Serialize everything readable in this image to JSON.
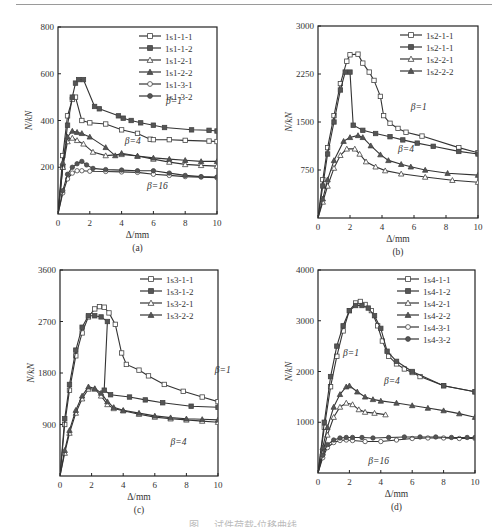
{
  "figure": {
    "caption_partial": "图 … 试件荷载-位移曲线 …"
  },
  "chart_data": [
    {
      "panel": "(a)",
      "type": "line",
      "xlabel": "Δ/mm",
      "ylabel": "N/kN",
      "xlim": [
        0,
        10
      ],
      "ylim": [
        0,
        800
      ],
      "xticks": [
        0,
        2,
        4,
        6,
        8,
        10
      ],
      "yticks": [
        200,
        400,
        600,
        800
      ],
      "ytick_labels": [
        "200",
        "400",
        "600",
        "800"
      ],
      "legend_position": "upper right",
      "series": [
        {
          "name": "1s1-1-1",
          "marker": "square-open",
          "x": [
            0,
            0.3,
            0.6,
            0.9,
            1.1,
            1.5,
            2.0,
            3.0,
            4.0,
            5.0,
            5.8,
            6.0,
            7.0,
            8.0,
            9.5,
            10
          ],
          "y": [
            0,
            250,
            420,
            490,
            500,
            400,
            390,
            385,
            360,
            345,
            320,
            318,
            318,
            315,
            312,
            310
          ]
        },
        {
          "name": "1s1-1-2",
          "marker": "square-filled",
          "x": [
            0,
            0.3,
            0.6,
            0.9,
            1.1,
            1.3,
            1.6,
            2.3,
            2.6,
            3.8,
            4.1,
            4.6,
            5.2,
            6.0,
            6.7,
            8.4,
            9.5,
            10
          ],
          "y": [
            0,
            200,
            380,
            500,
            560,
            575,
            575,
            460,
            450,
            420,
            410,
            400,
            390,
            380,
            370,
            360,
            358,
            355
          ]
        },
        {
          "name": "1s1-2-1",
          "marker": "triangle-open",
          "x": [
            0,
            0.3,
            0.6,
            0.9,
            1.2,
            1.6,
            2.2,
            3.0,
            4.0,
            5.0,
            6.0,
            7.0,
            8.0,
            9.0,
            10
          ],
          "y": [
            0,
            200,
            310,
            325,
            315,
            300,
            265,
            250,
            255,
            248,
            235,
            222,
            212,
            208,
            205
          ]
        },
        {
          "name": "1s1-2-2",
          "marker": "triangle-filled",
          "x": [
            0,
            0.3,
            0.6,
            0.9,
            1.2,
            1.5,
            2.0,
            3.0,
            3.6,
            4.0,
            5.0,
            6.0,
            7.0,
            8.0,
            9.0,
            10
          ],
          "y": [
            0,
            220,
            330,
            355,
            350,
            345,
            330,
            285,
            250,
            260,
            248,
            240,
            235,
            230,
            225,
            225
          ]
        },
        {
          "name": "1s1-3-1",
          "marker": "circle-open",
          "x": [
            0,
            0.3,
            0.6,
            0.9,
            1.2,
            1.5,
            2.0,
            3.0,
            4.0,
            5.0,
            6.0,
            7.0,
            8.0,
            9.0,
            10
          ],
          "y": [
            0,
            90,
            150,
            175,
            185,
            185,
            183,
            182,
            180,
            178,
            170,
            165,
            160,
            158,
            155
          ]
        },
        {
          "name": "1s1-3-2",
          "marker": "circle-filled",
          "x": [
            0,
            0.3,
            0.6,
            0.9,
            1.2,
            1.5,
            1.8,
            2.2,
            3.0,
            4.0,
            5.0,
            6.0,
            7.0,
            8.0,
            9.0,
            10
          ],
          "y": [
            0,
            100,
            170,
            200,
            215,
            225,
            210,
            195,
            190,
            188,
            185,
            185,
            175,
            165,
            160,
            158
          ]
        }
      ],
      "annotations": [
        {
          "text": "β=1",
          "x": 6.8,
          "y": 470
        },
        {
          "text": "β=4",
          "x": 4.2,
          "y": 300
        },
        {
          "text": "β=16",
          "x": 5.6,
          "y": 105
        }
      ]
    },
    {
      "panel": "(b)",
      "type": "line",
      "xlabel": "Δ/mm",
      "ylabel": "N/kN",
      "xlim": [
        0,
        10
      ],
      "ylim": [
        0,
        3000
      ],
      "xticks": [
        0,
        2,
        4,
        6,
        8,
        10
      ],
      "yticks": [
        750,
        1500,
        2250,
        3000
      ],
      "ytick_labels": [
        "750",
        "1500",
        "2250",
        "3000"
      ],
      "legend_position": "upper right",
      "series": [
        {
          "name": "1s2-1-1",
          "marker": "square-open",
          "x": [
            0,
            0.3,
            0.6,
            1.0,
            1.4,
            1.8,
            2.0,
            2.5,
            2.8,
            3.2,
            3.5,
            3.9,
            4.1,
            4.5,
            5.0,
            5.5,
            6.5,
            8.8,
            10
          ],
          "y": [
            0,
            600,
            1100,
            1600,
            2100,
            2450,
            2550,
            2560,
            2420,
            2280,
            2150,
            1900,
            1600,
            1480,
            1400,
            1340,
            1280,
            1100,
            1020
          ]
        },
        {
          "name": "1s2-1-1",
          "marker": "square-filled",
          "x": [
            0,
            0.3,
            0.6,
            1.0,
            1.4,
            1.7,
            2.0,
            2.2,
            2.8,
            3.6,
            4.5,
            5.3,
            6.2,
            7.2,
            8.8,
            10
          ],
          "y": [
            0,
            500,
            1000,
            1500,
            2000,
            2280,
            2280,
            1450,
            1370,
            1320,
            1270,
            1220,
            1170,
            1120,
            1040,
            1000
          ]
        },
        {
          "name": "1s2-2-1",
          "marker": "triangle-open",
          "x": [
            0,
            0.3,
            0.6,
            1.0,
            1.4,
            1.8,
            2.3,
            2.6,
            3.0,
            3.6,
            4.2,
            5.2,
            6.7,
            8.4,
            10
          ],
          "y": [
            0,
            250,
            500,
            780,
            980,
            1080,
            1080,
            1000,
            880,
            800,
            740,
            690,
            640,
            590,
            560
          ]
        },
        {
          "name": "1s2-2-2",
          "marker": "triangle-filled",
          "x": [
            0,
            0.3,
            0.6,
            1.0,
            1.6,
            2.0,
            2.5,
            2.8,
            3.3,
            3.9,
            4.4,
            5.2,
            5.8,
            6.7,
            8.1,
            10
          ],
          "y": [
            0,
            300,
            600,
            900,
            1200,
            1260,
            1290,
            1260,
            1130,
            990,
            900,
            840,
            800,
            750,
            700,
            670
          ]
        }
      ],
      "annotations": [
        {
          "text": "β=1",
          "x": 5.8,
          "y": 1680
        },
        {
          "text": "β=4",
          "x": 5.0,
          "y": 1030
        }
      ]
    },
    {
      "panel": "(c)",
      "type": "line",
      "xlabel": "Δ/mm",
      "ylabel": "N/kN",
      "xlim": [
        0,
        10
      ],
      "ylim": [
        0,
        3600
      ],
      "xticks": [
        0,
        2,
        4,
        6,
        8,
        10
      ],
      "yticks": [
        900,
        1800,
        2700,
        3600
      ],
      "ytick_labels": [
        "900",
        "1800",
        "2700",
        "3600"
      ],
      "legend_position": "upper right",
      "series": [
        {
          "name": "1s3-1-1",
          "marker": "square-open",
          "x": [
            0,
            0.3,
            0.6,
            1.0,
            1.4,
            1.8,
            2.2,
            2.5,
            2.8,
            3.1,
            3.5,
            3.9,
            4.2,
            5.0,
            5.6,
            6.6,
            7.8,
            9.0,
            10
          ],
          "y": [
            0,
            900,
            1500,
            2100,
            2500,
            2780,
            2920,
            2960,
            2950,
            2850,
            2650,
            2150,
            1950,
            1850,
            1750,
            1600,
            1480,
            1380,
            1300
          ]
        },
        {
          "name": "1s3-1-2",
          "marker": "square-filled",
          "x": [
            0,
            0.3,
            0.6,
            1.0,
            1.4,
            1.8,
            2.2,
            2.6,
            3.0,
            2.8,
            3.2,
            4.4,
            5.4,
            6.5,
            8.3,
            10
          ],
          "y": [
            0,
            1000,
            1600,
            2200,
            2600,
            2800,
            2800,
            2780,
            2700,
            1500,
            1420,
            1380,
            1330,
            1280,
            1220,
            1200
          ]
        },
        {
          "name": "1s3-2-1",
          "marker": "triangle-open",
          "x": [
            0,
            0.3,
            0.6,
            1.0,
            1.4,
            1.8,
            2.2,
            2.6,
            3.0,
            3.4,
            4.0,
            5.0,
            6.0,
            7.0,
            8.0,
            9.0,
            10
          ],
          "y": [
            0,
            400,
            750,
            1100,
            1350,
            1520,
            1520,
            1400,
            1250,
            1180,
            1140,
            1080,
            1030,
            1000,
            980,
            960,
            940
          ]
        },
        {
          "name": "1s3-2-2",
          "marker": "triangle-filled",
          "x": [
            0,
            0.3,
            0.6,
            1.0,
            1.4,
            1.8,
            2.2,
            2.6,
            3.0,
            3.4,
            4.0,
            5.0,
            6.0,
            7.0,
            8.0,
            9.0,
            10
          ],
          "y": [
            0,
            450,
            800,
            1150,
            1400,
            1560,
            1530,
            1450,
            1300,
            1200,
            1150,
            1100,
            1050,
            1020,
            1000,
            990,
            980
          ]
        }
      ],
      "annotations": [
        {
          "text": "β=1",
          "x": 9.8,
          "y": 1800
        },
        {
          "text": "β=4",
          "x": 7.0,
          "y": 540
        }
      ]
    },
    {
      "panel": "(d)",
      "type": "line",
      "xlabel": "Δ/mm",
      "ylabel": "N/kN",
      "xlim": [
        0,
        10
      ],
      "ylim": [
        0,
        4000
      ],
      "xticks": [
        0,
        2,
        4,
        6,
        8,
        10
      ],
      "yticks": [
        1000,
        2000,
        3000,
        4000
      ],
      "ytick_labels": [
        "1000",
        "2000",
        "3000",
        "4000"
      ],
      "legend_position": "upper right",
      "series": [
        {
          "name": "1s4-1-1",
          "marker": "square-open",
          "x": [
            0,
            0.4,
            0.8,
            1.2,
            1.6,
            2.0,
            2.4,
            2.7,
            3.0,
            3.4,
            3.8,
            4.1,
            4.5,
            5.0,
            5.5,
            6.0,
            6.5,
            8.0,
            10
          ],
          "y": [
            0,
            900,
            1700,
            2300,
            2800,
            3200,
            3350,
            3380,
            3320,
            3200,
            2900,
            2600,
            2300,
            2150,
            2050,
            1980,
            1900,
            1720,
            1600
          ]
        },
        {
          "name": "1s4-1-2",
          "marker": "square-filled",
          "x": [
            0,
            0.4,
            0.8,
            1.2,
            1.6,
            2.0,
            2.4,
            2.8,
            3.2,
            3.6,
            4.0,
            4.4,
            5.0,
            6.0,
            8.0,
            10
          ],
          "y": [
            0,
            1000,
            1900,
            2500,
            2900,
            3200,
            3300,
            3300,
            3250,
            3100,
            2850,
            2400,
            2200,
            2000,
            1720,
            1600
          ]
        },
        {
          "name": "1s4-2-1",
          "marker": "triangle-open",
          "x": [
            0,
            0.3,
            0.6,
            1.0,
            1.4,
            1.8,
            2.2,
            2.6,
            3.0,
            3.6,
            4.3
          ],
          "y": [
            0,
            400,
            750,
            1100,
            1300,
            1380,
            1350,
            1250,
            1200,
            1180,
            1150
          ]
        },
        {
          "name": "1s4-2-2",
          "marker": "triangle-filled",
          "x": [
            0,
            0.3,
            0.6,
            1.0,
            1.4,
            1.8,
            2.0,
            2.5,
            3.0,
            3.5,
            4.0,
            5.0,
            6.0,
            7.0,
            8.0,
            9.0,
            10
          ],
          "y": [
            0,
            500,
            900,
            1300,
            1550,
            1700,
            1720,
            1600,
            1500,
            1450,
            1420,
            1380,
            1330,
            1280,
            1230,
            1170,
            1100
          ]
        },
        {
          "name": "1s4-3-1",
          "marker": "circle-open",
          "x": [
            0,
            0.3,
            0.6,
            1.0,
            1.4,
            1.8,
            2.2,
            3.0,
            4.0,
            5.0,
            6.0,
            7.0,
            8.0,
            9.0,
            10
          ],
          "y": [
            0,
            300,
            500,
            600,
            640,
            650,
            640,
            620,
            620,
            650,
            680,
            690,
            690,
            680,
            680
          ]
        },
        {
          "name": "1s4-3-2",
          "marker": "circle-filled",
          "x": [
            0,
            0.3,
            0.6,
            1.0,
            1.4,
            1.8,
            2.2,
            2.8,
            3.5,
            4.5,
            5.5,
            6.5,
            7.5,
            8.5,
            9.5,
            10
          ],
          "y": [
            0,
            350,
            560,
            650,
            690,
            700,
            700,
            700,
            690,
            700,
            710,
            710,
            710,
            700,
            700,
            700
          ]
        }
      ],
      "annotations": [
        {
          "text": "β=1",
          "x": 1.6,
          "y": 2300
        },
        {
          "text": "β=4",
          "x": 4.2,
          "y": 1750
        },
        {
          "text": "β=16",
          "x": 3.2,
          "y": 180
        }
      ]
    }
  ]
}
